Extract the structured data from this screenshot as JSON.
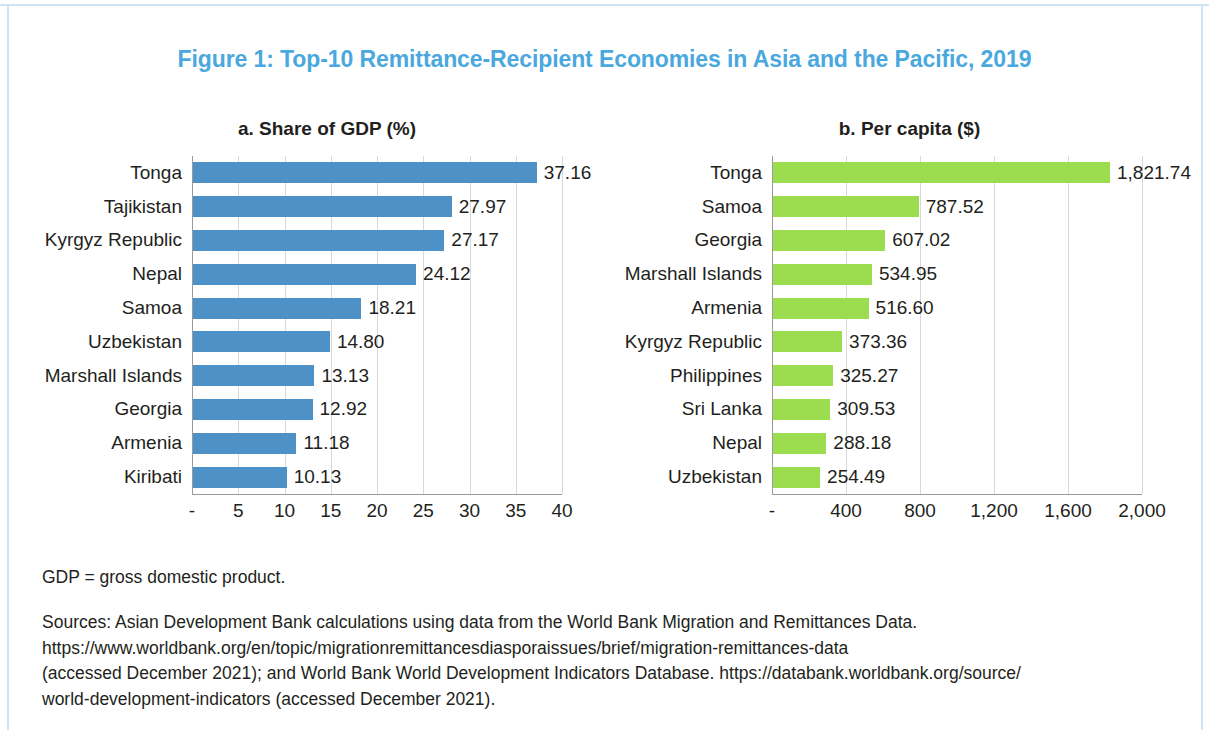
{
  "figure": {
    "title": "Figure 1: Top-10 Remittance-Recipient Economies in Asia and the Pacific, 2019",
    "title_color": "#4aa8de"
  },
  "notes": {
    "abbreviation": "GDP = gross domestic product.",
    "sources_line1": "Sources: Asian Development Bank calculations using data from the World Bank Migration and Remittances Data.",
    "sources_line2": "https://www.worldbank.org/en/topic/migrationremittancesdiasporaissues/brief/migration-remittances-data",
    "sources_line3": "(accessed December 2021); and World Bank World Development Indicators Database. https://databank.worldbank.org/source/",
    "sources_line4": "world-development-indicators (accessed December 2021)."
  },
  "chart_data": [
    {
      "type": "bar",
      "orientation": "horizontal",
      "title": "a. Share of GDP (%)",
      "xlabel": "",
      "ylabel": "",
      "color": "#4e91c7",
      "xlim": [
        0,
        40
      ],
      "grid": true,
      "legend": "none",
      "xticks": [
        0,
        5,
        10,
        15,
        20,
        25,
        30,
        35,
        40
      ],
      "xticklabels": [
        "-",
        "5",
        "10",
        "15",
        "20",
        "25",
        "30",
        "35",
        "40"
      ],
      "categories": [
        "Tonga",
        "Tajikistan",
        "Kyrgyz Republic",
        "Nepal",
        "Samoa",
        "Uzbekistan",
        "Marshall Islands",
        "Georgia",
        "Armenia",
        "Kiribati"
      ],
      "values": [
        37.16,
        27.97,
        27.17,
        24.12,
        18.21,
        14.8,
        13.13,
        12.92,
        11.18,
        10.13
      ],
      "value_labels": [
        "37.16",
        "27.97",
        "27.17",
        "24.12",
        "18.21",
        "14.80",
        "13.13",
        "12.92",
        "11.18",
        "10.13"
      ]
    },
    {
      "type": "bar",
      "orientation": "horizontal",
      "title": "b. Per capita ($)",
      "xlabel": "",
      "ylabel": "",
      "color": "#9bdd4f",
      "xlim": [
        0,
        2000
      ],
      "grid": true,
      "legend": "none",
      "xticks": [
        0,
        400,
        800,
        1200,
        1600,
        2000
      ],
      "xticklabels": [
        "-",
        "400",
        "800",
        "1,200",
        "1,600",
        "2,000"
      ],
      "categories": [
        "Tonga",
        "Samoa",
        "Georgia",
        "Marshall Islands",
        "Armenia",
        "Kyrgyz Republic",
        "Philippines",
        "Sri Lanka",
        "Nepal",
        "Uzbekistan"
      ],
      "values": [
        1821.74,
        787.52,
        607.02,
        534.95,
        516.6,
        373.36,
        325.27,
        309.53,
        288.18,
        254.49
      ],
      "value_labels": [
        "1,821.74",
        "787.52",
        "607.02",
        "534.95",
        "516.60",
        "373.36",
        "325.27",
        "309.53",
        "288.18",
        "254.49"
      ]
    }
  ]
}
